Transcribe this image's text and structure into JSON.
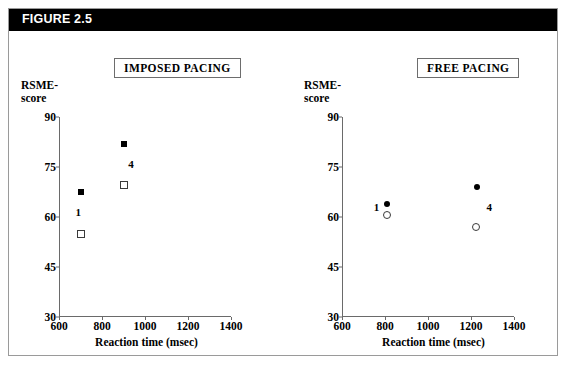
{
  "figure": {
    "header_label": "FIGURE 2.5"
  },
  "chart_data": [
    {
      "type": "scatter",
      "title": "IMPOSED PACING",
      "xlabel": "Reaction time (msec)",
      "ylabel": "RSME-score",
      "ylabel_line1": "RSME-",
      "ylabel_line2": "score",
      "xlim": [
        600,
        1400
      ],
      "ylim": [
        30,
        90
      ],
      "xticks": [
        600,
        800,
        1000,
        1200,
        1400
      ],
      "yticks": [
        90,
        75,
        60,
        45,
        30
      ],
      "grid": false,
      "legend": "none",
      "series": [
        {
          "name": "filled-square",
          "marker": "filled-square",
          "points": [
            {
              "x": 700,
              "y": 67.5
            },
            {
              "x": 900,
              "y": 82
            }
          ]
        },
        {
          "name": "open-square",
          "marker": "open-square",
          "points": [
            {
              "x": 700,
              "y": 55
            },
            {
              "x": 900,
              "y": 69.5
            }
          ]
        }
      ],
      "annotations": [
        {
          "text": "1",
          "x": 690,
          "y": 61.5
        },
        {
          "text": "4",
          "x": 935,
          "y": 76
        }
      ]
    },
    {
      "type": "scatter",
      "title": "FREE PACING",
      "xlabel": "Reaction time (msec)",
      "ylabel": "RSME-score",
      "ylabel_line1": "RSME-",
      "ylabel_line2": "score",
      "xlim": [
        600,
        1400
      ],
      "ylim": [
        30,
        90
      ],
      "xticks": [
        600,
        800,
        1000,
        1200,
        1400
      ],
      "yticks": [
        90,
        75,
        60,
        45,
        30
      ],
      "grid": false,
      "legend": "none",
      "series": [
        {
          "name": "filled-circle",
          "marker": "filled-circle",
          "points": [
            {
              "x": 810,
              "y": 64
            },
            {
              "x": 1230,
              "y": 69
            }
          ]
        },
        {
          "name": "open-circle",
          "marker": "open-circle",
          "points": [
            {
              "x": 810,
              "y": 60.5
            },
            {
              "x": 1225,
              "y": 57
            }
          ]
        }
      ],
      "annotations": [
        {
          "text": "1",
          "x": 760,
          "y": 63
        },
        {
          "text": "4",
          "x": 1285,
          "y": 63
        }
      ]
    }
  ]
}
